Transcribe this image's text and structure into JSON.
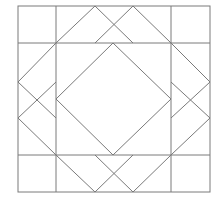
{
  "diagram": {
    "title": "",
    "type": "quilt-block-pattern",
    "stroke_color": "#7a7a7a",
    "background": "#ffffff",
    "outer_square": {
      "x1": 18,
      "y1": 6,
      "x2": 210,
      "y2": 192
    },
    "grid": {
      "vertical_x": [
        56,
        171
      ],
      "horizontal_y": [
        43,
        155
      ]
    },
    "segments": [
      [
        56,
        43,
        95,
        6
      ],
      [
        95,
        6,
        133,
        43
      ],
      [
        133,
        6,
        95,
        43
      ],
      [
        133,
        6,
        171,
        43
      ],
      [
        171,
        43,
        210,
        82
      ],
      [
        210,
        82,
        171,
        118
      ],
      [
        210,
        118,
        171,
        82
      ],
      [
        210,
        118,
        171,
        155
      ],
      [
        171,
        155,
        133,
        192
      ],
      [
        133,
        192,
        95,
        155
      ],
      [
        133,
        155,
        95,
        192
      ],
      [
        95,
        192,
        56,
        155
      ],
      [
        56,
        155,
        18,
        118
      ],
      [
        18,
        118,
        56,
        82
      ],
      [
        18,
        82,
        56,
        118
      ],
      [
        18,
        82,
        56,
        43
      ],
      [
        113,
        43,
        171,
        99
      ],
      [
        171,
        99,
        113,
        155
      ],
      [
        113,
        155,
        56,
        99
      ],
      [
        56,
        99,
        113,
        43
      ]
    ]
  }
}
